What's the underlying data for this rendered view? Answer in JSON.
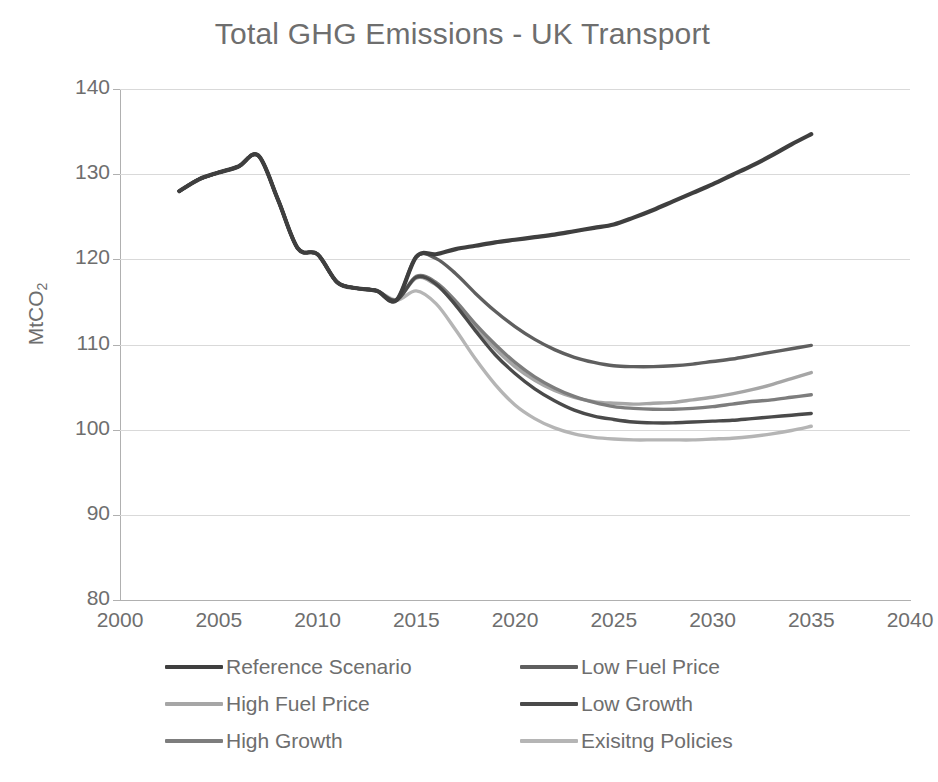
{
  "chart_data": {
    "type": "line",
    "title": "Total GHG Emissions - UK Transport",
    "xlabel": "",
    "ylabel": "MtCO2",
    "ylabel_base": "MtCO",
    "ylabel_sub": "2",
    "xlim": [
      2000,
      2040
    ],
    "ylim": [
      80,
      140
    ],
    "xticks": [
      2000,
      2005,
      2010,
      2015,
      2020,
      2025,
      2030,
      2035,
      2040
    ],
    "yticks": [
      80,
      90,
      100,
      110,
      120,
      130,
      140
    ],
    "grid": "horizontal",
    "legend_position": "bottom",
    "x": [
      2003,
      2004,
      2005,
      2006,
      2007,
      2008,
      2009,
      2010,
      2011,
      2012,
      2013,
      2014,
      2015,
      2016,
      2017,
      2018,
      2019,
      2020,
      2021,
      2022,
      2023,
      2024,
      2025,
      2026,
      2027,
      2028,
      2029,
      2030,
      2031,
      2032,
      2033,
      2034,
      2035
    ],
    "series": [
      {
        "name": "Reference Scenario",
        "color": "#3f3f3f",
        "values": [
          128.0,
          129.4,
          130.2,
          130.9,
          132.2,
          127.0,
          121.3,
          120.6,
          117.3,
          116.6,
          116.3,
          115.2,
          120.3,
          120.6,
          121.2,
          121.6,
          122.0,
          122.3,
          122.6,
          122.9,
          123.3,
          123.7,
          124.1,
          124.9,
          125.8,
          126.8,
          127.8,
          128.8,
          129.9,
          131.0,
          132.2,
          133.5,
          134.7
        ]
      },
      {
        "name": "Low Fuel Price",
        "color": "#5f5f5f",
        "values": [
          128.0,
          129.4,
          130.2,
          130.9,
          132.2,
          127.0,
          121.3,
          120.6,
          117.3,
          116.6,
          116.3,
          115.2,
          120.3,
          120.1,
          118.3,
          116.0,
          113.9,
          112.1,
          110.6,
          109.4,
          108.5,
          107.9,
          107.5,
          107.4,
          107.4,
          107.5,
          107.7,
          108.0,
          108.3,
          108.7,
          109.1,
          109.5,
          109.9
        ]
      },
      {
        "name": "High Fuel Price",
        "color": "#a6a6a6",
        "values": [
          128.0,
          129.4,
          130.2,
          130.9,
          132.2,
          127.0,
          121.3,
          120.6,
          117.3,
          116.6,
          116.3,
          115.2,
          117.8,
          117.0,
          114.7,
          112.0,
          109.5,
          107.4,
          105.8,
          104.6,
          103.8,
          103.3,
          103.1,
          103.0,
          103.1,
          103.2,
          103.5,
          103.8,
          104.2,
          104.7,
          105.3,
          106.0,
          106.7
        ]
      },
      {
        "name": "Low Growth",
        "color": "#4a4a4a",
        "values": [
          128.0,
          129.4,
          130.2,
          130.9,
          132.2,
          127.0,
          121.3,
          120.6,
          117.3,
          116.6,
          116.3,
          115.2,
          117.9,
          117.1,
          114.6,
          111.6,
          108.8,
          106.6,
          104.8,
          103.4,
          102.3,
          101.6,
          101.2,
          100.9,
          100.8,
          100.8,
          100.9,
          101.0,
          101.1,
          101.3,
          101.5,
          101.7,
          101.9
        ]
      },
      {
        "name": "High Growth",
        "color": "#7d7d7d",
        "values": [
          128.0,
          129.4,
          130.2,
          130.9,
          132.2,
          127.0,
          121.3,
          120.6,
          117.3,
          116.6,
          116.3,
          115.2,
          118.0,
          117.3,
          115.1,
          112.4,
          110.0,
          107.9,
          106.2,
          104.9,
          103.9,
          103.2,
          102.7,
          102.5,
          102.4,
          102.4,
          102.5,
          102.7,
          103.0,
          103.3,
          103.5,
          103.8,
          104.1
        ]
      },
      {
        "name": "Exisitng Policies",
        "color": "#b5b5b5",
        "values": [
          128.0,
          129.4,
          130.2,
          130.9,
          132.2,
          127.0,
          121.3,
          120.6,
          117.3,
          116.6,
          116.3,
          115.2,
          116.3,
          114.8,
          111.7,
          108.3,
          105.3,
          102.9,
          101.3,
          100.2,
          99.5,
          99.1,
          98.9,
          98.8,
          98.8,
          98.8,
          98.8,
          98.9,
          99.0,
          99.2,
          99.5,
          99.9,
          100.4
        ]
      }
    ]
  },
  "legend": {
    "items": [
      {
        "label": "Reference Scenario",
        "color": "#3f3f3f",
        "col": 0,
        "row": 0
      },
      {
        "label": "Low Fuel Price",
        "color": "#5f5f5f",
        "col": 1,
        "row": 0
      },
      {
        "label": "High Fuel Price",
        "color": "#a6a6a6",
        "col": 0,
        "row": 1
      },
      {
        "label": "Low Growth",
        "color": "#4a4a4a",
        "col": 1,
        "row": 1
      },
      {
        "label": "High Growth",
        "color": "#7d7d7d",
        "col": 0,
        "row": 2
      },
      {
        "label": "Exisitng Policies",
        "color": "#b5b5b5",
        "col": 1,
        "row": 2
      }
    ]
  },
  "style": {
    "gridline_color": "#d9d9d9",
    "axis_color": "#b0b0b0",
    "text_color": "#6e6e6e"
  }
}
